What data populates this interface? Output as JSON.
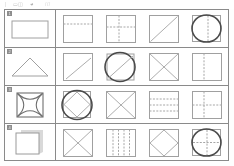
{
  "header": {
    "fragment_1": "|",
    "fragment_2": "▭◫",
    "fragment_3": "◕",
    "fragment_4": "///"
  },
  "table": {
    "rows": [
      {
        "label": "1",
        "query": {
          "name": "rectangle",
          "caption": "rectangle"
        },
        "results": [
          {
            "name": "square-with-horizontal-dashed-line",
            "caption": "square with horizontal dashed line"
          },
          {
            "name": "square-with-dashed-cross",
            "caption": "square with dashed cross"
          },
          {
            "name": "square-with-diagonal",
            "caption": "square with diagonal line"
          },
          {
            "name": "circle-over-square-with-vertical-line",
            "caption": "bold circle with vertical line"
          }
        ]
      },
      {
        "label": "2",
        "query": {
          "name": "triangle",
          "caption": "triangle"
        },
        "results": [
          {
            "name": "square-with-diagonal",
            "caption": "square with diagonal line"
          },
          {
            "name": "circle-with-diagonal",
            "caption": "bold circle with diagonal line"
          },
          {
            "name": "square-with-x",
            "caption": "square with X"
          },
          {
            "name": "square-with-vertical-dashed-line",
            "caption": "square with vertical dashed line"
          }
        ]
      },
      {
        "label": "3",
        "query": {
          "name": "square-with-curved-x",
          "caption": "square with curved X"
        },
        "results": [
          {
            "name": "circle-diamond-square",
            "caption": "bold circle over diamond in square"
          },
          {
            "name": "square-with-x",
            "caption": "square with X"
          },
          {
            "name": "square-with-three-horizontal-dashed-lines",
            "caption": "square with three horizontal dashed lines"
          },
          {
            "name": "square-with-dashed-cross",
            "caption": "square with dashed cross"
          }
        ]
      },
      {
        "label": "4",
        "query": {
          "name": "folded-page",
          "caption": "folded page"
        },
        "results": [
          {
            "name": "square-with-x",
            "caption": "square with X"
          },
          {
            "name": "square-with-four-vertical-dashed-lines",
            "caption": "square with four vertical dashed lines"
          },
          {
            "name": "square-with-diamond",
            "caption": "square with inscribed diamond"
          },
          {
            "name": "circle-with-dashed-cross",
            "caption": "bold circle with dashed cross"
          }
        ]
      }
    ]
  },
  "colors": {
    "grid_line": "#8a8a8a",
    "shape_stroke": "#9a9a9a",
    "bold_stroke": "#4a4a4a",
    "background": "#ffffff"
  }
}
